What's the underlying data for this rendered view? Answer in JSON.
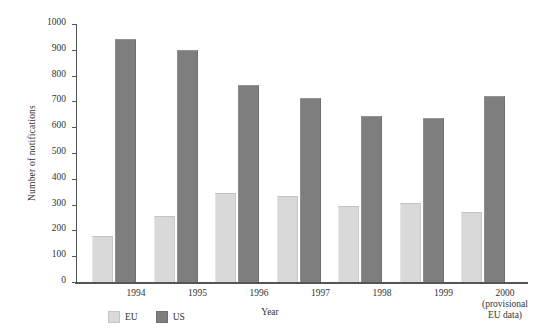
{
  "chart_data": {
    "type": "bar",
    "title": "",
    "xlabel": "Year",
    "ylabel": "Number of notifications",
    "categories": [
      "1994",
      "1995",
      "1996",
      "1997",
      "1998",
      "1999",
      "2000"
    ],
    "category_sublabels": [
      "",
      "",
      "",
      "",
      "",
      "",
      "(provisional\nEU data)"
    ],
    "series": [
      {
        "name": "EU",
        "color": "#d9d9d9",
        "values": [
          180,
          255,
          345,
          335,
          295,
          305,
          270
        ]
      },
      {
        "name": "US",
        "color": "#7e7e7e",
        "values": [
          940,
          900,
          765,
          715,
          645,
          635,
          720
        ]
      }
    ],
    "ylim": [
      0,
      1000
    ],
    "ytick_labels": [
      "0",
      "100",
      "200",
      "300",
      "400",
      "500",
      "600",
      "700",
      "800",
      "900",
      "1000"
    ],
    "ytick_values": [
      0,
      100,
      200,
      300,
      400,
      500,
      600,
      700,
      800,
      900,
      1000
    ],
    "grid": false,
    "legend_position": "bottom-left",
    "legend_entries": [
      "EU",
      "US"
    ]
  },
  "axis": {
    "y_title": "Number of notifications",
    "x_title": "Year"
  },
  "x_labels": [
    {
      "main": "1994",
      "sub": ""
    },
    {
      "main": "1995",
      "sub": ""
    },
    {
      "main": "1996",
      "sub": ""
    },
    {
      "main": "1997",
      "sub": ""
    },
    {
      "main": "1998",
      "sub": ""
    },
    {
      "main": "1999",
      "sub": ""
    },
    {
      "main": "2000",
      "sub_line1": "(provisional",
      "sub_line2": "EU data)"
    }
  ],
  "legend": {
    "items": [
      {
        "label": "EU",
        "color": "#d9d9d9"
      },
      {
        "label": "US",
        "color": "#7e7e7e"
      }
    ]
  }
}
